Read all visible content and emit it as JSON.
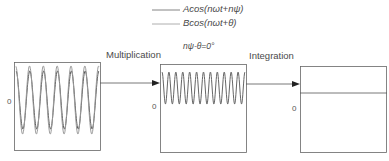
{
  "legend": {
    "items": [
      {
        "label": "Acos(nωt+nψ)",
        "color": "#555555"
      },
      {
        "label": "Bcos(nωt+θ)",
        "color": "#888888"
      }
    ]
  },
  "condition_label": "nψ-θ=0°",
  "steps": [
    {
      "label": "Multiplication"
    },
    {
      "label": "Integration"
    }
  ],
  "panels": [
    {
      "name": "input-signals",
      "zero_label": "0",
      "description": "two overlapping sinusoids, ~6 cycles"
    },
    {
      "name": "product-signal",
      "zero_label": "0",
      "description": "double-frequency sinusoid offset above zero, ~12 cycles"
    },
    {
      "name": "integrated-result",
      "zero_label": "0",
      "description": "constant positive DC level"
    }
  ],
  "colors": {
    "line": "#555555",
    "box": "#666666",
    "arrow": "#222222"
  }
}
